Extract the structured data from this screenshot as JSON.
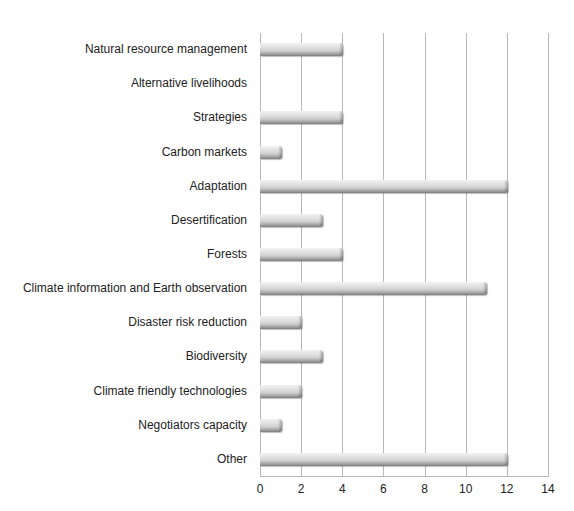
{
  "chart_data": {
    "type": "bar",
    "orientation": "horizontal",
    "title": "",
    "xlabel": "",
    "ylabel": "",
    "xlim": [
      0,
      14
    ],
    "xticks": [
      "0",
      "2",
      "4",
      "6",
      "8",
      "10",
      "12",
      "14"
    ],
    "grid": true,
    "legend": null,
    "categories": [
      "Natural resource management",
      "Alternative livelihoods",
      "Strategies",
      "Carbon markets",
      "Adaptation",
      "Desertification",
      "Forests",
      "Climate information and Earth observation",
      "Disaster risk reduction",
      "Biodiversity",
      "Climate friendly technologies",
      "Negotiators capacity",
      "Other"
    ],
    "values": [
      4,
      0,
      4,
      1,
      12,
      3,
      4,
      11,
      2,
      3,
      2,
      1,
      12
    ],
    "bar_color": "#cfcfcf"
  }
}
